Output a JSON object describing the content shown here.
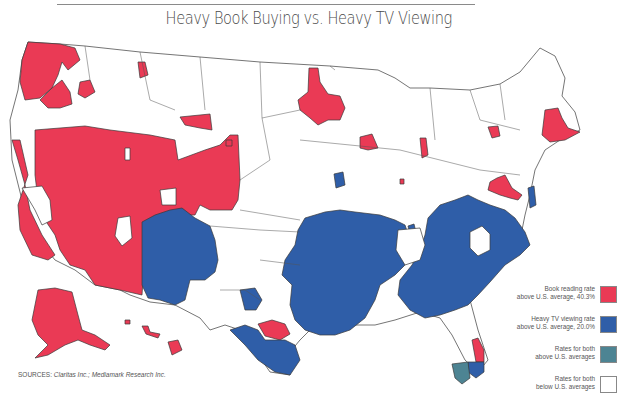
{
  "title": "Heavy Book Buying vs. Heavy TV Viewing",
  "colors": {
    "book": "#ea3a55",
    "tv": "#2f5ea8",
    "both": "#4d8493",
    "neither": "#ffffff",
    "border": "#333333"
  },
  "legend": {
    "items": [
      {
        "line1": "Book reading rate",
        "line2": "above U.S. average, 40.3%",
        "category": "book",
        "color": "#ea3a55"
      },
      {
        "line1": "Heavy TV viewing rate",
        "line2": "above U.S. average, 20.0%",
        "category": "tv",
        "color": "#2f5ea8"
      },
      {
        "line1": "Rates for both",
        "line2": "above U.S. averages",
        "category": "both",
        "color": "#4d8493"
      },
      {
        "line1": "Rates for both",
        "line2": "below U.S. averages",
        "category": "neither",
        "color": "#ffffff"
      }
    ]
  },
  "sources": {
    "label": "SOURCES:",
    "text": "Claritas Inc.; Mediamark Research Inc."
  },
  "map": {
    "region": "United States (media markets)",
    "highlighted_areas": {
      "book": [
        "Pacific Northwest (WA/OR coast)",
        "California",
        "Nevada",
        "Utah",
        "Colorado",
        "Arizona",
        "Wyoming south",
        "Minnesota (Minneapolis)",
        "Wisconsin (Madison)",
        "Michigan (Lansing)",
        "Upstate New York",
        "Massachusetts/Boston",
        "Connecticut",
        "Washington DC/Maryland",
        "Austin TX",
        "East Florida",
        "Alaska",
        "Hawaii"
      ],
      "tv": [
        "New Mexico",
        "West Texas",
        "South Texas",
        "Oklahoma/Arkansas",
        "Louisiana/Mississippi",
        "Alabama/Georgia",
        "Tennessee/Kentucky",
        "Carolinas",
        "Virginia",
        "Delaware"
      ],
      "both": [
        "Southwest Florida",
        "Miami area"
      ]
    }
  }
}
